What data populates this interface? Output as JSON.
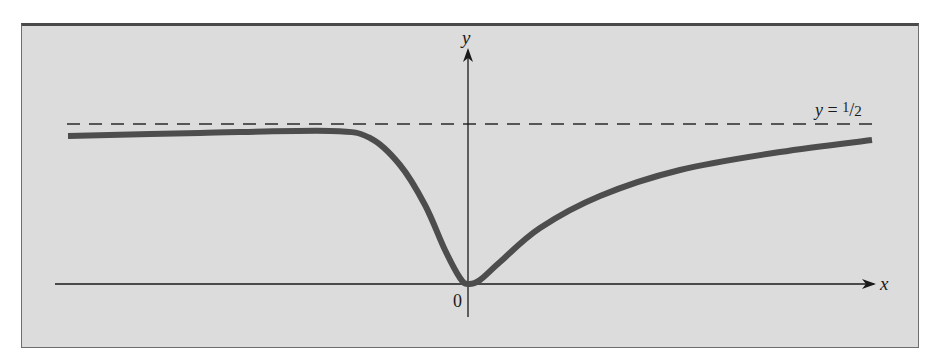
{
  "figure": {
    "background_color": "#dcdcdc",
    "frame_color": "#4a4a4a",
    "curve_color": "#4d4d4d",
    "axis_color": "#1a1a1a"
  },
  "chart_data": {
    "type": "line",
    "title": "",
    "xlabel": "x",
    "ylabel": "y",
    "origin_label": "0",
    "asymptote": {
      "label_prefix": "y = ",
      "label_num": "1",
      "label_den": "2",
      "value": 0.5,
      "style": "dashed"
    },
    "grid": false,
    "legend": null,
    "series": [
      {
        "name": "f(x)",
        "description": "Curve approaching slightly above 1/2 from the left, dips to a minimum of 0 at x = 0, then rises toward 1/2 from below as x → ∞",
        "points_px": [
          [
            68,
            136
          ],
          [
            200,
            133
          ],
          [
            330,
            131
          ],
          [
            370,
            138
          ],
          [
            400,
            165
          ],
          [
            425,
            205
          ],
          [
            445,
            250
          ],
          [
            460,
            278
          ],
          [
            468,
            284
          ],
          [
            480,
            280
          ],
          [
            500,
            262
          ],
          [
            540,
            228
          ],
          [
            600,
            196
          ],
          [
            680,
            170
          ],
          [
            780,
            152
          ],
          [
            872,
            140
          ]
        ]
      }
    ],
    "ylim": [
      0,
      0.55
    ]
  }
}
